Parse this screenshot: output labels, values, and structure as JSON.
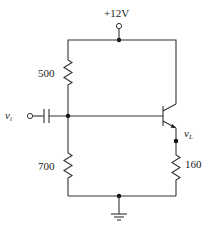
{
  "diagram": {
    "type": "circuit-schematic",
    "supply": {
      "label": "+12V"
    },
    "input": {
      "label": "v",
      "subscript": "i"
    },
    "output": {
      "label": "v",
      "subscript": "L"
    },
    "components": [
      {
        "id": "R1",
        "type": "resistor",
        "value": "500",
        "position": "upper-bias"
      },
      {
        "id": "R2",
        "type": "resistor",
        "value": "700",
        "position": "lower-bias"
      },
      {
        "id": "RL",
        "type": "resistor",
        "value": "160",
        "position": "emitter-load"
      },
      {
        "id": "C1",
        "type": "capacitor",
        "value": "",
        "position": "input-coupling"
      },
      {
        "id": "Q1",
        "type": "npn-transistor",
        "value": "",
        "position": "emitter-follower"
      },
      {
        "id": "GND",
        "type": "ground",
        "value": ""
      }
    ],
    "labels": {
      "supply": "+12V",
      "r_upper": "500",
      "r_lower": "700",
      "r_load": "160",
      "vi_main": "v",
      "vi_sub": "i",
      "vl_main": "v",
      "vl_sub": "L"
    }
  }
}
